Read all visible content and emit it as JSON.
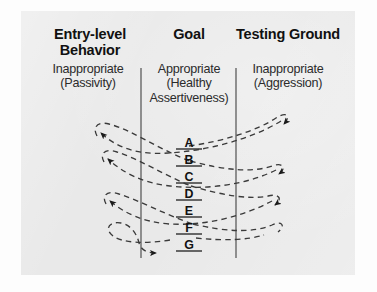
{
  "figure": {
    "background_color": "#e9e9e9",
    "page_color": "#fdfdfd",
    "ink_color": "#2b2b2b",
    "heading_color": "#111111"
  },
  "columns": [
    {
      "id": "entry-level",
      "heading": "Entry-level Behavior",
      "subtitle_line1": "Inappropriate",
      "subtitle_line2": "(Passivity)"
    },
    {
      "id": "goal",
      "heading": "Goal",
      "subtitle_line1": "Appropriate",
      "subtitle_line2": "(Healthy",
      "subtitle_line3": "Assertiveness)"
    },
    {
      "id": "testing-ground",
      "heading": "Testing Ground",
      "subtitle_line1": "Inappropriate",
      "subtitle_line2": "(Aggression)"
    }
  ],
  "steps": [
    {
      "label": "A",
      "y": 143
    },
    {
      "label": "B",
      "y": 160
    },
    {
      "label": "C",
      "y": 177
    },
    {
      "label": "D",
      "y": 194
    },
    {
      "label": "E",
      "y": 211
    },
    {
      "label": "F",
      "y": 228
    },
    {
      "label": "G",
      "y": 245
    }
  ],
  "dividers": [
    {
      "id": "left-divider",
      "x": 141,
      "y_top": 68,
      "y_bottom": 258
    },
    {
      "id": "right-divider",
      "x": 236,
      "y_top": 68,
      "y_bottom": 258
    }
  ],
  "arrows": {
    "toward_entry_level": 4,
    "toward_testing_ground": 3,
    "style": "dashed-curve-with-solid-arrowhead"
  }
}
